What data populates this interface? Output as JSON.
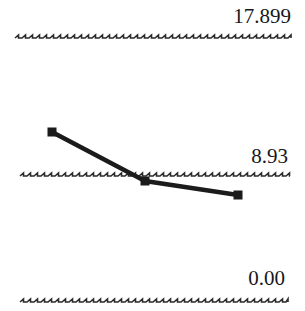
{
  "chart_data": {
    "type": "line",
    "title": "",
    "subtitle": "",
    "xlabel": "",
    "ylabel": "",
    "grid": true,
    "gridline_style": "wavy",
    "legend": "none",
    "marker": "square",
    "marker_color": "#1b1b1b",
    "line_color": "#1b1b1b",
    "x": [
      1,
      2,
      3
    ],
    "values": [
      11.8,
      8.6,
      7.6
    ],
    "series": [
      {
        "name": "series-1",
        "values": [
          11.8,
          8.6,
          7.6
        ]
      }
    ],
    "ylim": [
      0.0,
      17.899
    ],
    "yticks": [
      0.0,
      8.93,
      17.899
    ],
    "ytick_labels": [
      "0.00",
      "8.93",
      "17.899"
    ]
  },
  "axis": {
    "labels": {
      "top": "17.899",
      "middle": "8.93",
      "bottom": "0.00"
    }
  },
  "colors": {
    "background": "#ffffff",
    "ink": "#1b1b1b",
    "text": "#17181a",
    "gridline": "#2a2a2a"
  },
  "geometry": {
    "width": 305,
    "height": 311,
    "gridlines": [
      {
        "name": "top",
        "y": 38,
        "x_start": 15,
        "x_end": 291
      },
      {
        "name": "middle",
        "y": 176,
        "x_start": 20,
        "x_end": 290
      },
      {
        "name": "bottom",
        "y": 302,
        "x_start": 20,
        "x_end": 288
      }
    ],
    "points": [
      {
        "x": 52,
        "y": 132
      },
      {
        "x": 145,
        "y": 181
      },
      {
        "x": 238,
        "y": 195
      }
    ],
    "marker_size": 9,
    "line_width": 4.6,
    "wave_period": 7,
    "wave_amplitude": 3
  }
}
